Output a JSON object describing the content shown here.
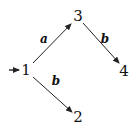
{
  "diagram": {
    "type": "finite-automaton",
    "initial_state": "1",
    "nodes": [
      {
        "id": "1",
        "label": "1",
        "x": 26,
        "y": 70
      },
      {
        "id": "2",
        "label": "2",
        "x": 77,
        "y": 117
      },
      {
        "id": "3",
        "label": "3",
        "x": 77,
        "y": 17
      },
      {
        "id": "4",
        "label": "4",
        "x": 123,
        "y": 72
      }
    ],
    "edges": [
      {
        "from": "1",
        "to": "3",
        "label": "a"
      },
      {
        "from": "3",
        "to": "4",
        "label": "b"
      },
      {
        "from": "1",
        "to": "2",
        "label": "b"
      }
    ],
    "edge_labels": {
      "e13": "a",
      "e34": "b",
      "e12": "b"
    },
    "colors": {
      "stroke": "#222222",
      "text": "#111111",
      "background": "#ffffff"
    }
  }
}
